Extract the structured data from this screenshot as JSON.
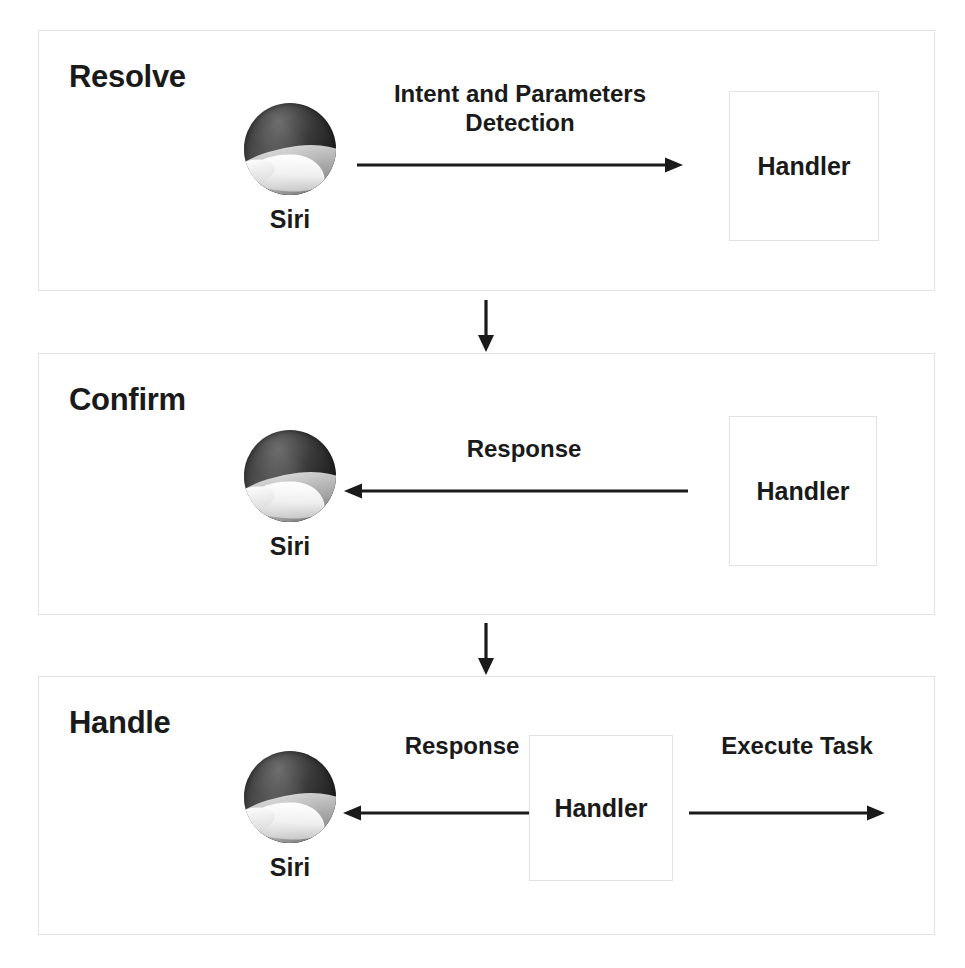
{
  "diagram": {
    "colors": {
      "panel_border": "#e2e2e2",
      "text": "#1a1a1a",
      "arrow": "#1a1a1a",
      "background": "#ffffff"
    },
    "connectors": [
      {
        "name": "resolve-to-confirm",
        "direction": "down"
      },
      {
        "name": "confirm-to-handle",
        "direction": "down"
      }
    ],
    "panels": [
      {
        "id": "resolve",
        "title": "Resolve",
        "actor": {
          "label": "Siri",
          "icon": "siri-icon"
        },
        "target": {
          "label": "Handler"
        },
        "edges": [
          {
            "name": "intent-and-parameters-detection",
            "label": "Intent and Parameters\nDetection",
            "direction": "right",
            "from": "Siri",
            "to": "Handler"
          }
        ]
      },
      {
        "id": "confirm",
        "title": "Confirm",
        "actor": {
          "label": "Siri",
          "icon": "siri-icon"
        },
        "target": {
          "label": "Handler"
        },
        "edges": [
          {
            "name": "response",
            "label": "Response",
            "direction": "left",
            "from": "Handler",
            "to": "Siri"
          }
        ]
      },
      {
        "id": "handle",
        "title": "Handle",
        "actor": {
          "label": "Siri",
          "icon": "siri-icon"
        },
        "target": {
          "label": "Handler"
        },
        "edges": [
          {
            "name": "response",
            "label": "Response",
            "direction": "left",
            "from": "Handler",
            "to": "Siri"
          },
          {
            "name": "execute-task",
            "label": "Execute Task",
            "direction": "right",
            "from": "Handler",
            "to": "external"
          }
        ]
      }
    ]
  }
}
